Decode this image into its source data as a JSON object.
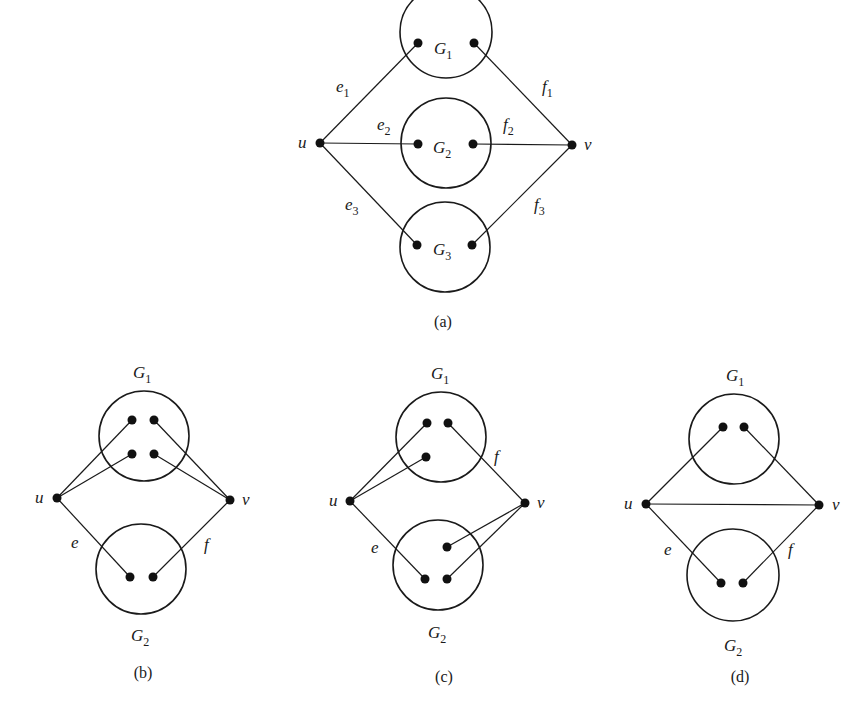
{
  "colors": {
    "ink": "#1a1a1a",
    "background": "#ffffff"
  },
  "figures": {
    "a": {
      "caption": "(a)",
      "u_label": "u",
      "v_label": "v",
      "subgraphs": [
        {
          "name": "G",
          "sub": "1"
        },
        {
          "name": "G",
          "sub": "2"
        },
        {
          "name": "G",
          "sub": "3"
        }
      ],
      "edges_u": [
        {
          "name": "e",
          "sub": "1"
        },
        {
          "name": "e",
          "sub": "2"
        },
        {
          "name": "e",
          "sub": "3"
        }
      ],
      "edges_v": [
        {
          "name": "f",
          "sub": "1"
        },
        {
          "name": "f",
          "sub": "2"
        },
        {
          "name": "f",
          "sub": "3"
        }
      ]
    },
    "b": {
      "caption": "(b)",
      "u_label": "u",
      "v_label": "v",
      "g1": {
        "name": "G",
        "sub": "1"
      },
      "g2": {
        "name": "G",
        "sub": "2"
      },
      "e_label": "e",
      "f_label": "f"
    },
    "c": {
      "caption": "(c)",
      "u_label": "u",
      "v_label": "v",
      "g1": {
        "name": "G",
        "sub": "1"
      },
      "g2": {
        "name": "G",
        "sub": "2"
      },
      "e_label": "e",
      "f_label": "f"
    },
    "d": {
      "caption": "(d)",
      "u_label": "u",
      "v_label": "v",
      "g1": {
        "name": "G",
        "sub": "1"
      },
      "g2": {
        "name": "G",
        "sub": "2"
      },
      "e_label": "e",
      "f_label": "f"
    }
  }
}
